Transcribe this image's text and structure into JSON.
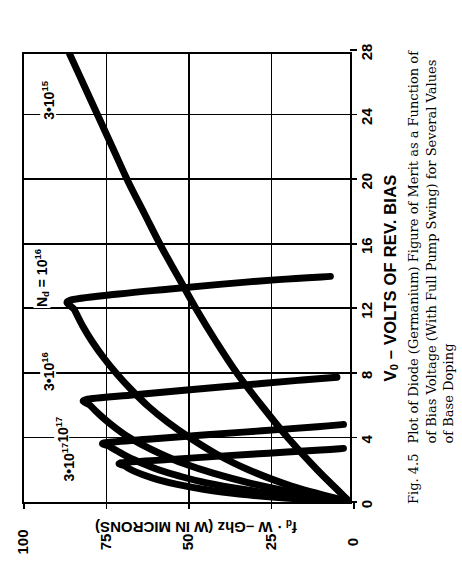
{
  "figure": {
    "number": "Fig. 4.5",
    "caption_lines": [
      "Plot of Diode (Germanium) Figure of Merit as a Function of",
      "of Bias Voltage (With Full Pump Swing) for Several Values",
      "of Base Doping"
    ]
  },
  "chart_data": {
    "type": "line",
    "xlabel": "V0 – VOLTS OF REV. BIAS",
    "ylabel": "fd · W – Ghz (W IN MICRONS)",
    "xlabel_html": "V<sub>0</sub> &ndash; VOLTS OF REV. BIAS",
    "ylabel_html": "f<sub>d</sub> &middot; W &ndash;Ghz (W IN MICRONS)",
    "xlim": [
      0,
      28
    ],
    "ylim": [
      0,
      100
    ],
    "xticks": [
      0,
      4,
      8,
      12,
      16,
      20,
      24,
      28
    ],
    "xtick_labels": [
      "0",
      "4",
      "8",
      "12",
      "16",
      "20",
      "24",
      "28"
    ],
    "yticks": [
      0,
      25,
      50,
      75,
      100
    ],
    "ytick_labels": [
      "0",
      "25",
      "50",
      "75",
      "100"
    ],
    "grid": true,
    "grid_axes": "both",
    "legend": "inline-curve-labels",
    "line_color": "#000000",
    "line_width_px": 7,
    "series": [
      {
        "name": "3e15",
        "label_html": "3&bull;10<sup>15</sup>",
        "label_text": "3•10^15",
        "label_x": 25.0,
        "label_y": 92.0,
        "points": [
          [
            0,
            0
          ],
          [
            2,
            10
          ],
          [
            4,
            19
          ],
          [
            6,
            27
          ],
          [
            8,
            34.5
          ],
          [
            10,
            41
          ],
          [
            12,
            47
          ],
          [
            14,
            52.5
          ],
          [
            16,
            58
          ],
          [
            18,
            63
          ],
          [
            20,
            68
          ],
          [
            22,
            72.5
          ],
          [
            24,
            77
          ],
          [
            26,
            81.5
          ],
          [
            28,
            86
          ]
        ]
      },
      {
        "name": "1e16",
        "label_html": "N<sub>d</sub> = 10<sup>16</sup>",
        "label_text": "Nd = 10^16",
        "label_x": 14.0,
        "label_y": 94.0,
        "points": [
          [
            0,
            0
          ],
          [
            1,
            18
          ],
          [
            2,
            31
          ],
          [
            3,
            41
          ],
          [
            4,
            49
          ],
          [
            5,
            56
          ],
          [
            6,
            62
          ],
          [
            7,
            67
          ],
          [
            8,
            71.5
          ],
          [
            9,
            75.5
          ],
          [
            10,
            79
          ],
          [
            11,
            82
          ],
          [
            12,
            84.5
          ],
          [
            12.6,
            86
          ],
          [
            13,
            71
          ],
          [
            13.3,
            56
          ],
          [
            13.6,
            40
          ],
          [
            13.9,
            22
          ],
          [
            14.1,
            6
          ]
        ]
      },
      {
        "name": "3e16",
        "label_html": "3&bull;10<sup>16</sup>",
        "label_text": "3•10^16",
        "label_x": 8.2,
        "label_y": 92.0,
        "points": [
          [
            0,
            0
          ],
          [
            0.6,
            17
          ],
          [
            1.2,
            31
          ],
          [
            1.8,
            42
          ],
          [
            2.4,
            51
          ],
          [
            3.0,
            58
          ],
          [
            3.6,
            64
          ],
          [
            4.2,
            69
          ],
          [
            4.8,
            73
          ],
          [
            5.4,
            76.5
          ],
          [
            6.0,
            79.5
          ],
          [
            6.4,
            81
          ],
          [
            6.7,
            66
          ],
          [
            7.0,
            50
          ],
          [
            7.3,
            33
          ],
          [
            7.6,
            16
          ],
          [
            7.8,
            4
          ]
        ]
      },
      {
        "name": "1e17",
        "label_html": "10<sup>17</sup>",
        "label_text": "10^17",
        "label_x": 4.6,
        "label_y": 88.0,
        "points": [
          [
            0,
            0
          ],
          [
            0.4,
            19
          ],
          [
            0.8,
            33
          ],
          [
            1.2,
            44
          ],
          [
            1.6,
            52
          ],
          [
            2.0,
            58.5
          ],
          [
            2.4,
            63.5
          ],
          [
            2.8,
            68
          ],
          [
            3.2,
            71.5
          ],
          [
            3.5,
            74
          ],
          [
            3.7,
            75
          ],
          [
            3.95,
            60
          ],
          [
            4.2,
            44
          ],
          [
            4.45,
            27
          ],
          [
            4.7,
            10
          ],
          [
            4.85,
            2
          ]
        ]
      },
      {
        "name": "3e17",
        "label_html": "3&bull;10<sup>17</sup>",
        "label_text": "3•10^17",
        "label_x": 2.6,
        "label_y": 86.0,
        "points": [
          [
            0,
            0
          ],
          [
            0.25,
            20
          ],
          [
            0.5,
            34
          ],
          [
            0.8,
            45
          ],
          [
            1.1,
            53
          ],
          [
            1.4,
            59
          ],
          [
            1.7,
            63.5
          ],
          [
            2.0,
            67
          ],
          [
            2.25,
            69
          ],
          [
            2.45,
            70
          ],
          [
            2.65,
            56
          ],
          [
            2.85,
            41
          ],
          [
            3.05,
            25
          ],
          [
            3.25,
            9
          ],
          [
            3.35,
            2
          ]
        ]
      }
    ]
  }
}
